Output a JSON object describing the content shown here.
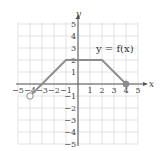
{
  "chart_data": {
    "type": "line",
    "title": "",
    "annotation": "y = f(x)",
    "xlabel": "x",
    "ylabel": "y",
    "xlim": [
      -5,
      5
    ],
    "ylim": [
      -5,
      5
    ],
    "grid": true,
    "x_ticks": [
      -5,
      -4,
      -3,
      -2,
      -1,
      1,
      2,
      3,
      4,
      5
    ],
    "y_ticks": [
      -5,
      -4,
      -3,
      -2,
      -1,
      1,
      2,
      3,
      4,
      5
    ],
    "series": [
      {
        "name": "f(x)",
        "points": [
          [
            -4,
            -1
          ],
          [
            -1,
            2
          ],
          [
            2,
            2
          ],
          [
            4,
            0
          ]
        ],
        "start_endpoint": {
          "x": -4,
          "y": -1,
          "style": "open"
        },
        "end_endpoint": {
          "x": 4,
          "y": 0,
          "style": "closed"
        }
      }
    ],
    "colors": {
      "curve": "#8c8c8c",
      "grid": "#dcdcdc",
      "axis": "#555555"
    }
  }
}
